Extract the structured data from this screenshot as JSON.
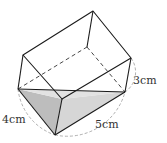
{
  "diagram": {
    "type": "rectangular prism tilted, with shaded triangular cross-section",
    "labels": {
      "edge_a": "4cm",
      "edge_b": "5cm",
      "edge_c": "3cm"
    },
    "colors": {
      "stroke": "#1a1a1a",
      "hidden": "#333333",
      "arc": "#9a9a9a",
      "shade_dark": "#bdbdbd",
      "shade_light": "#dedede"
    }
  }
}
